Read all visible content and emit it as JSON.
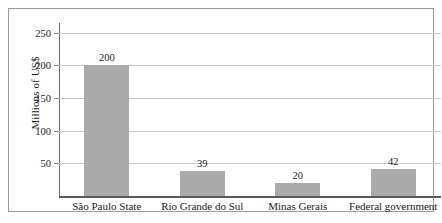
{
  "chart_data": {
    "type": "bar",
    "title": "",
    "xlabel": "",
    "ylabel": "Millions of US$",
    "categories": [
      "São Paulo State",
      "Rio Grande do Sul",
      "Minas Gerais",
      "Federal government"
    ],
    "values": [
      200,
      39,
      20,
      42
    ],
    "value_labels": [
      "200",
      "39",
      "20",
      "42"
    ],
    "yticks": [
      50,
      100,
      150,
      200,
      250
    ],
    "ytick_labels": [
      "50",
      "100",
      "150",
      "200",
      "250"
    ],
    "ylim": [
      0,
      265
    ],
    "grid": true,
    "legend": false,
    "bar_color": "#ababab",
    "gridline_color": "#c9c9c9",
    "axis_color": "#5a5a5a",
    "text_color": "#1b1b1b",
    "background": "#ffffff"
  }
}
